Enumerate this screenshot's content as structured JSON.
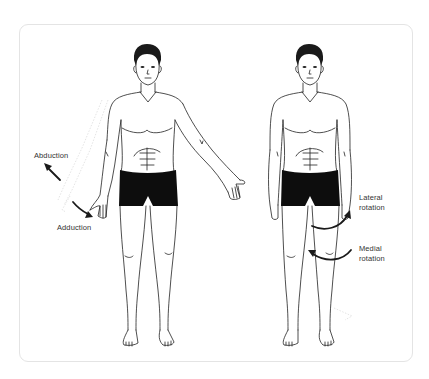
{
  "diagram": {
    "type": "anatomical-illustration",
    "frame": {
      "border_color": "#e4e4e4",
      "background": "#ffffff"
    },
    "figures": [
      {
        "id": "left-figure",
        "pose": "left arm shown in abduction/adduction, right arm abducted",
        "labels": [
          {
            "text": "Abduction",
            "arrow": "up-left"
          },
          {
            "text": "Adduction",
            "arrow": "down-right"
          }
        ]
      },
      {
        "id": "right-figure",
        "pose": "standing, arms at sides, hip rotation shown on left leg",
        "labels": [
          {
            "line1": "Lateral",
            "line2": "rotation",
            "arrow": "curved-right-up"
          },
          {
            "line1": "Medial",
            "line2": "rotation",
            "arrow": "curved-left"
          }
        ]
      }
    ],
    "colors": {
      "outline": "#222222",
      "shorts": "#0d0d0d",
      "hair": "#1a1a1a",
      "arrow": "#1a1a1a",
      "label_text": "#333333"
    }
  }
}
